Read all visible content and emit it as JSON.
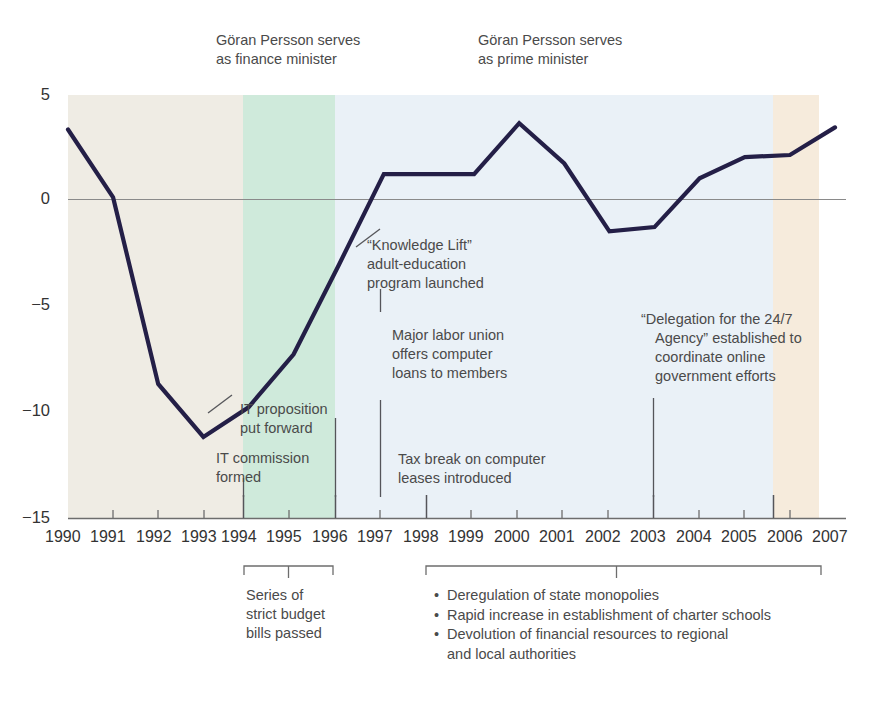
{
  "chart_data": {
    "type": "line",
    "title": "",
    "subtitle": "",
    "xlabel": "",
    "ylabel": "",
    "x": [
      1990,
      1991,
      1992,
      1993,
      1994,
      1995,
      1996,
      1997,
      1998,
      1999,
      2000,
      2001,
      2002,
      2003,
      2004,
      2005,
      2006,
      2007
    ],
    "categories": [
      "1990",
      "1991",
      "1992",
      "1993",
      "1994",
      "1995",
      "1996",
      "1997",
      "1998",
      "1999",
      "2000",
      "2001",
      "2002",
      "2003",
      "2004",
      "2005",
      "2006",
      "2007"
    ],
    "values": [
      3.3,
      0.1,
      -8.7,
      -11.2,
      -9.8,
      -7.3,
      -3.1,
      1.2,
      1.2,
      1.2,
      3.6,
      1.7,
      -1.5,
      -1.3,
      1.0,
      2.0,
      2.1,
      3.4
    ],
    "series": [
      {
        "name": "Sweden budget balance (% of GDP)",
        "values": [
          3.3,
          0.1,
          -8.7,
          -11.2,
          -9.8,
          -7.3,
          -3.1,
          1.2,
          1.2,
          1.2,
          3.6,
          1.7,
          -1.5,
          -1.3,
          1.0,
          2.0,
          2.1,
          3.4
        ],
        "color": "#241f47"
      }
    ],
    "ylim": [
      -15,
      5
    ],
    "xlim": [
      1990,
      2007
    ],
    "yticks": [
      5,
      0,
      -5,
      -10,
      -15
    ],
    "ytick_labels": [
      "5",
      "0",
      "−5",
      "−10",
      "−15"
    ],
    "grid": false,
    "zero_line": true,
    "legend": "none",
    "bands": [
      {
        "name": "pre-1994",
        "from": 1990,
        "to": 1994,
        "color": "#efece4",
        "label": ""
      },
      {
        "name": "finance-minister",
        "from": 1994,
        "to": 1996,
        "color": "#cfeadb",
        "label": "Göran Persson serves as finance minister"
      },
      {
        "name": "prime-minister",
        "from": 1996,
        "to": 2006,
        "color": "#eaf1f7",
        "label": "Göran Persson serves as prime minister"
      },
      {
        "name": "post-2006",
        "from": 2006,
        "to": 2007,
        "color": "#f6ebdc",
        "label": ""
      }
    ]
  },
  "axes": {
    "y_tick_labels": [
      "5",
      "0",
      "−5",
      "−10",
      "−15"
    ],
    "x_tick_labels": [
      "1990",
      "1991",
      "1992",
      "1993",
      "1994",
      "1995",
      "1996",
      "1997",
      "1998",
      "1999",
      "2000",
      "2001",
      "2002",
      "2003",
      "2004",
      "2005",
      "2006",
      "2007"
    ]
  },
  "top_annotations": [
    {
      "id": "finance-minister",
      "line1": "Göran Persson serves",
      "line2": "as finance minister"
    },
    {
      "id": "prime-minister",
      "line1": "Göran Persson serves",
      "line2": "as prime minister"
    }
  ],
  "callouts": [
    {
      "id": "knowledge-lift",
      "lines": [
        "“Knowledge Lift”",
        "adult-education",
        "program launched"
      ],
      "anchor_year": 1997
    },
    {
      "id": "labor-union-computer-loans",
      "lines": [
        "Major labor union",
        "offers computer",
        "loans to members"
      ],
      "anchor_year": 1997
    },
    {
      "id": "it-proposition",
      "lines": [
        "IT proposition",
        "put forward"
      ],
      "anchor_year": 1996
    },
    {
      "id": "it-commission",
      "lines": [
        "IT commission",
        "formed"
      ],
      "anchor_year": 1994
    },
    {
      "id": "tax-break-computer-leases",
      "lines": [
        "Tax break on computer",
        "leases introduced"
      ],
      "anchor_year": 1998
    },
    {
      "id": "delegation-24-7-agency",
      "lines": [
        "“Delegation for the 24/7",
        "Agency” established to",
        "coordinate online",
        "government efforts"
      ],
      "anchor_year": 2003
    }
  ],
  "brackets": [
    {
      "id": "strict-budget-bills",
      "from_year": 1994,
      "to_year": 1996,
      "lines": [
        "Series of",
        "strict budget",
        "bills passed"
      ]
    },
    {
      "id": "reform-bullets",
      "from_year": 1998,
      "to_year": 2007,
      "bullets": [
        {
          "text": "Deregulation of state monopolies",
          "continuation": ""
        },
        {
          "text": "Rapid increase in establishment of charter schools",
          "continuation": ""
        },
        {
          "text": "Devolution of financial resources to regional",
          "continuation": "and local authorities"
        }
      ]
    }
  ],
  "colors": {
    "line": "#241f47",
    "band_beige": "#efece4",
    "band_green": "#cfeadb",
    "band_blue": "#eaf1f7",
    "band_tan": "#f6ebdc",
    "zero_line": "#8a8a8a",
    "text": "#4a4a4a"
  }
}
